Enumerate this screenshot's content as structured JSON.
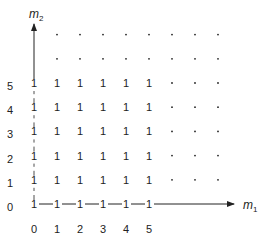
{
  "diagram": {
    "title": "",
    "axes": {
      "x": {
        "label": "m",
        "subscript": "1",
        "ticks": [
          "0",
          "1",
          "2",
          "3",
          "4",
          "5"
        ]
      },
      "y": {
        "label": "m",
        "subscript": "2",
        "ticks": [
          "0",
          "1",
          "2",
          "3",
          "4",
          "5"
        ]
      }
    },
    "grid": {
      "value": "1",
      "filled_cols": 6,
      "filled_rows": 6,
      "ellipsis_cols": 3,
      "ellipsis_rows": 2,
      "ellipsis_glyph": "·",
      "note": "Cells (m1, m2) with 0 ≤ m1,m2 ≤ 5 contain 1; beyond shown as dots. Row m2=0 connected by solid line, column m1=0 connected by dashed line."
    },
    "colors": {
      "ink": "#222222",
      "background": "#ffffff"
    }
  }
}
